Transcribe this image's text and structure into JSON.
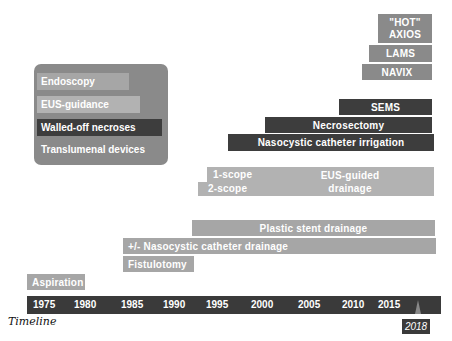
{
  "legend": {
    "items": [
      {
        "label": "Endoscopy",
        "color": "#a6a6a6"
      },
      {
        "label": "EUS-guidance",
        "color": "#b2b2b2"
      },
      {
        "label": "Walled-off necroses",
        "color": "#3d3d3d"
      },
      {
        "label": "Translumenal devices",
        "color": "#8a8a8a"
      }
    ]
  },
  "bars": {
    "hot_axios_line1": "\"HOT\"",
    "hot_axios_line2": "AXIOS",
    "lams": "LAMS",
    "navix": "NAVIX",
    "sems": "SEMS",
    "necrosectomy": "Necrosectomy",
    "nasocystic_irrigation": "Nasocystic catheter irrigation",
    "one_scope": "1-scope",
    "two_scope": "2-scope",
    "eus_drainage_line1": "EUS-guided",
    "eus_drainage_line2": "drainage",
    "plastic_stent": "Plastic stent drainage",
    "nasocystic_drainage": "+/- Nasocystic catheter drainage",
    "fistulotomy": "Fistulotomy",
    "aspiration": "Aspiration"
  },
  "timeline": {
    "label": "Timeline",
    "years": [
      "1975",
      "1980",
      "1985",
      "1990",
      "1995",
      "2000",
      "2005",
      "2010",
      "2015"
    ],
    "marker": "2018"
  }
}
